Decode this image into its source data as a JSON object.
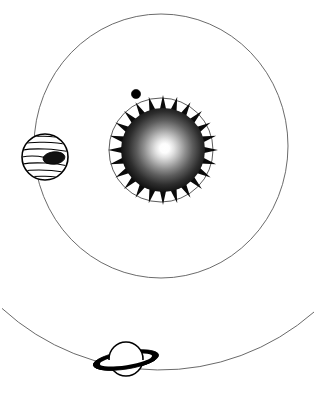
{
  "figure": {
    "background_color": "#ffffff",
    "width": 317,
    "height": 395,
    "style": "black-and-white line-art clip-art",
    "caption": ""
  },
  "sun": {
    "label": "Sun",
    "center": {
      "x": 163,
      "y": 150
    },
    "core_radius": 42,
    "corona_outer_radius": 55,
    "corona_spike_count": 24,
    "gradient": {
      "type": "radial",
      "hotspot": {
        "x": 168,
        "y": 147
      },
      "inner_color": "#ffffff",
      "mid_color": "#8a8a8a",
      "outer_color": "#000000"
    },
    "outline_color": "#000000"
  },
  "orbits": [
    {
      "name": "inner-orbit",
      "label": "Inner orbit",
      "shape": "circle",
      "center": {
        "x": 161,
        "y": 150
      },
      "rx": 52,
      "ry": 52,
      "stroke_color": "#4a4a4a",
      "stroke_width": 0.9
    },
    {
      "name": "middle-orbit",
      "label": "Middle orbit",
      "shape": "ellipse",
      "center": {
        "x": 161,
        "y": 146
      },
      "rx": 127,
      "ry": 132,
      "stroke_color": "#5a5a5a",
      "stroke_width": 0.9
    },
    {
      "name": "outer-orbit",
      "label": "Outer orbit",
      "shape": "arc",
      "center": {
        "x": 160,
        "y": 140
      },
      "rx": 232,
      "ry": 230,
      "stroke_color": "#6a6a6a",
      "stroke_width": 1.0
    }
  ],
  "bodies": [
    {
      "name": "inner-planet",
      "label": "Inner planet",
      "type": "small-dot",
      "center": {
        "x": 136,
        "y": 94
      },
      "radius": 4.6,
      "fill_color": "#000000",
      "on_orbit": "inner-orbit"
    },
    {
      "name": "jupiter",
      "label": "Jupiter",
      "type": "banded-gas-giant",
      "center": {
        "x": 45,
        "y": 157
      },
      "radius": 23,
      "body_fill": "#ffffff",
      "outline_color": "#000000",
      "band_count": 6,
      "spot": {
        "label": "Great Red Spot",
        "center": {
          "x": 54,
          "y": 158
        },
        "rx": 11,
        "ry": 6.2,
        "fill_color": "#111111",
        "rotation_deg": -6
      },
      "on_orbit": "middle-orbit"
    },
    {
      "name": "saturn",
      "label": "Saturn",
      "type": "ringed-planet",
      "center": {
        "x": 126,
        "y": 360
      },
      "radius": 17,
      "body_fill": "#ffffff",
      "outline_color": "#000000",
      "ring": {
        "label": "Saturn rings",
        "rx": 33,
        "ry": 9,
        "rotation_deg": -9,
        "fill_color": "#000000"
      },
      "on_orbit": "outer-orbit"
    }
  ]
}
